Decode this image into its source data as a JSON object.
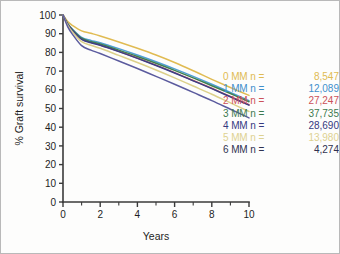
{
  "figure": {
    "background_color": "#fdfdfc",
    "border_color": "#b9b9b9"
  },
  "chart_data": {
    "type": "line",
    "title": "",
    "xlabel": "Years",
    "ylabel": "% Graft survival",
    "xlim": [
      0,
      10
    ],
    "ylim": [
      0,
      100
    ],
    "xticks": [
      0,
      1,
      2,
      3,
      4,
      5,
      6,
      7,
      8,
      9,
      10
    ],
    "xtick_labels": [
      "0",
      "",
      "2",
      "",
      "4",
      "",
      "6",
      "",
      "8",
      "",
      "10"
    ],
    "yticks": [
      0,
      10,
      20,
      30,
      40,
      50,
      60,
      70,
      80,
      90,
      100
    ],
    "ytick_labels": [
      "0",
      "10",
      "20",
      "30",
      "40",
      "50",
      "60",
      "70",
      "80",
      "90",
      "100"
    ],
    "grid": false,
    "legend_position": "right",
    "x": [
      0,
      0.25,
      0.5,
      1,
      1.5,
      2,
      3,
      4,
      5,
      6,
      7,
      8,
      9,
      10
    ],
    "series": [
      {
        "name": "0 MM",
        "n": "8,547",
        "color": "#e0bb52",
        "values": [
          100,
          96.5,
          94.5,
          91.5,
          90.2,
          88.8,
          85.6,
          82.2,
          78.6,
          74.6,
          70.2,
          65.6,
          61.2,
          57.0
        ]
      },
      {
        "name": "1 MM",
        "n": "12,089",
        "color": "#4f9fd4",
        "values": [
          100,
          95.5,
          92.5,
          88.0,
          86.4,
          85.2,
          82.0,
          78.6,
          75.0,
          71.2,
          67.2,
          63.0,
          58.6,
          54.2
        ]
      },
      {
        "name": "2 MM",
        "n": "27,247",
        "color": "#c9545a",
        "values": [
          100,
          95.2,
          92.0,
          87.2,
          85.4,
          84.0,
          80.6,
          77.0,
          73.2,
          69.2,
          65.0,
          60.8,
          56.4,
          52.0
        ]
      },
      {
        "name": "3 MM",
        "n": "37,735",
        "color": "#3f7f52",
        "values": [
          100,
          95.3,
          92.2,
          87.6,
          85.8,
          84.5,
          81.2,
          77.8,
          74.2,
          70.4,
          66.4,
          62.2,
          58.0,
          53.6
        ]
      },
      {
        "name": "4 MM",
        "n": "28,690",
        "color": "#3b3f86",
        "values": [
          100,
          95.0,
          91.8,
          87.0,
          85.2,
          83.8,
          80.4,
          76.8,
          73.0,
          69.0,
          64.8,
          60.6,
          56.2,
          51.8
        ]
      },
      {
        "name": "5 MM",
        "n": "13,980",
        "color": "#dcd08a",
        "values": [
          100,
          94.6,
          91.0,
          85.8,
          83.8,
          82.2,
          78.4,
          74.6,
          70.6,
          66.4,
          62.0,
          57.6,
          53.0,
          48.4
        ]
      },
      {
        "name": "6 MM",
        "n": "4,274",
        "color": "#5b5b9e",
        "values": [
          100,
          93.8,
          89.8,
          83.6,
          81.2,
          79.4,
          75.4,
          71.4,
          67.2,
          63.0,
          58.6,
          54.2,
          49.6,
          45.0
        ]
      }
    ],
    "legend_entries": [
      {
        "label": "0 MM n =",
        "value": "8,547",
        "color": "#e0bb52"
      },
      {
        "label": "1 MM n =",
        "value": "12,089",
        "color": "#3f8fcc"
      },
      {
        "label": "2 MM n =",
        "value": "27,247",
        "color": "#cc5159"
      },
      {
        "label": "3 MM n =",
        "value": "37,735",
        "color": "#3d7a4f"
      },
      {
        "label": "4 MM n =",
        "value": "28,690",
        "color": "#35397f"
      },
      {
        "label": "5 MM n =",
        "value": "13,980",
        "color": "#ddd291"
      },
      {
        "label": "6 MM n =",
        "value": "4,274",
        "color": "#2f3150"
      }
    ]
  }
}
